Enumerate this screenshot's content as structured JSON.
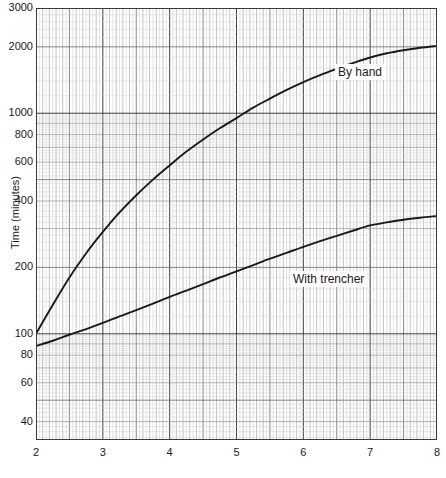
{
  "chart_data": {
    "type": "line",
    "title": "",
    "subtitle": "",
    "xlabel": "",
    "ylabel": "Time (minutes)",
    "xscale": "linear",
    "yscale": "log",
    "xlim": [
      2,
      8
    ],
    "ylim": [
      33,
      3000
    ],
    "grid": true,
    "grid_style": "log-log graph paper, fine minor grid",
    "legend_position": "inline-annotation",
    "xticks": [
      2,
      3,
      4,
      5,
      6,
      7,
      8
    ],
    "xticklabels": [
      "2",
      "3",
      "4",
      "5",
      "6",
      "7",
      "8"
    ],
    "yticks": [
      40,
      60,
      80,
      100,
      200,
      400,
      600,
      800,
      1000,
      2000,
      3000
    ],
    "yticklabels": [
      "40",
      "60",
      "80",
      "100",
      "200",
      "400",
      "600",
      "800",
      "1000",
      "2000",
      "3000"
    ],
    "series": [
      {
        "name": "By hand",
        "label": "By hand",
        "color": "#1a1a1a",
        "x": [
          2.0,
          2.25,
          2.5,
          2.75,
          3.0,
          3.25,
          3.5,
          3.75,
          4.0,
          4.25,
          4.5,
          4.75,
          5.0,
          5.25,
          5.5,
          5.75,
          6.0,
          6.25,
          6.5,
          6.75,
          7.0,
          7.25,
          7.5,
          7.75,
          8.0
        ],
        "values": [
          100,
          135,
          180,
          232,
          290,
          355,
          425,
          500,
          580,
          670,
          760,
          855,
          950,
          1060,
          1165,
          1275,
          1385,
          1490,
          1590,
          1690,
          1790,
          1870,
          1930,
          1980,
          2020
        ]
      },
      {
        "name": "With trencher",
        "label": "With trencher",
        "color": "#1a1a1a",
        "x": [
          2.0,
          2.25,
          2.5,
          2.75,
          3.0,
          3.25,
          3.5,
          3.75,
          4.0,
          4.25,
          4.5,
          4.75,
          5.0,
          5.25,
          5.5,
          5.75,
          6.0,
          6.25,
          6.5,
          6.75,
          7.0,
          7.25,
          7.5,
          7.75,
          8.0
        ],
        "values": [
          88,
          93,
          99,
          105,
          112,
          120,
          128,
          137,
          147,
          157,
          168,
          180,
          192,
          205,
          219,
          233,
          248,
          263,
          278,
          294,
          310,
          320,
          329,
          336,
          342
        ]
      }
    ],
    "annotations": [
      {
        "text": "By hand",
        "x": 7.0,
        "y": 1400
      },
      {
        "text": "With trencher",
        "x": 6.3,
        "y": 255
      }
    ]
  },
  "axes": {
    "y_title": "Time (minutes)",
    "x_title": ""
  },
  "labels": {
    "by_hand": "By hand",
    "with_trencher": "With trencher"
  }
}
